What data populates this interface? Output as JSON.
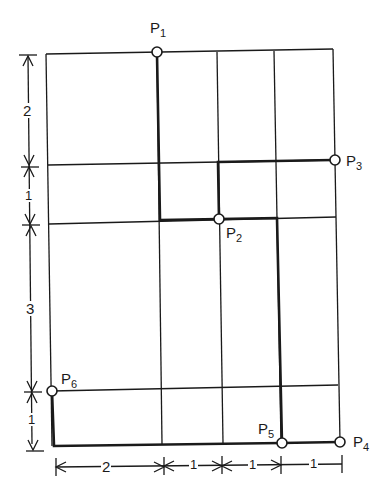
{
  "diagram": {
    "type": "grid-route",
    "colors": {
      "line": "#1a1a1a",
      "background": "#ffffff",
      "node_fill": "#ffffff"
    },
    "points": [
      {
        "id": "P1",
        "letter": "P",
        "sub": "1"
      },
      {
        "id": "P2",
        "letter": "P",
        "sub": "2"
      },
      {
        "id": "P3",
        "letter": "P",
        "sub": "3"
      },
      {
        "id": "P4",
        "letter": "P",
        "sub": "4"
      },
      {
        "id": "P5",
        "letter": "P",
        "sub": "5"
      },
      {
        "id": "P6",
        "letter": "P",
        "sub": "6"
      }
    ],
    "vertical_dimensions": [
      "2",
      "1",
      "3",
      "1"
    ],
    "horizontal_dimensions": [
      "2",
      "1",
      "1",
      "1"
    ],
    "route": [
      "P1",
      "P2",
      "P3",
      "P5",
      "P4",
      "P6"
    ]
  }
}
